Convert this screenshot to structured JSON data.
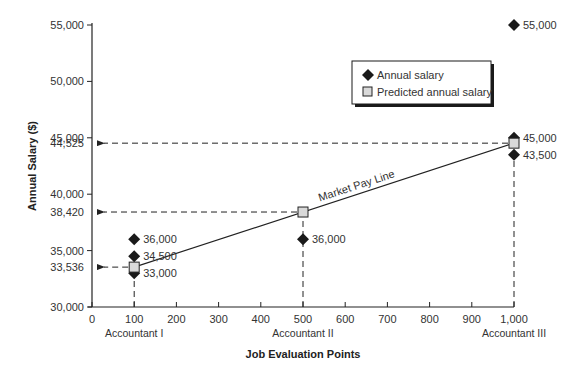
{
  "chart_data": {
    "type": "scatter",
    "title": "",
    "xlabel": "Job Evaluation Points",
    "ylabel": "Annual Salary ($)",
    "xlim": [
      0,
      1000
    ],
    "ylim": [
      30000,
      55000
    ],
    "x_ticks": [
      0,
      100,
      200,
      300,
      400,
      500,
      600,
      700,
      800,
      900,
      1000
    ],
    "x_tick_labels": [
      "0",
      "100",
      "200",
      "300",
      "400",
      "500",
      "600",
      "700",
      "800",
      "900",
      "1,000"
    ],
    "y_ticks": [
      30000,
      35000,
      40000,
      45000,
      50000,
      55000
    ],
    "y_tick_labels": [
      "30,000",
      "35,000",
      "40,000",
      "45,000",
      "50,000",
      "55,000"
    ],
    "y_extra_labels": [
      {
        "value": 33536,
        "label": "33,536"
      },
      {
        "value": 38420,
        "label": "38,420"
      },
      {
        "value": 44525,
        "label": "44,525"
      }
    ],
    "categories": [
      {
        "x": 100,
        "label": "Accountant I"
      },
      {
        "x": 500,
        "label": "Accountant II"
      },
      {
        "x": 1000,
        "label": "Accountant III"
      }
    ],
    "grid": false,
    "legend_position": "upper right",
    "series": [
      {
        "name": "Annual salary",
        "marker": "diamond",
        "color": "#1a1a1a",
        "points": [
          {
            "x": 100,
            "y": 36000,
            "label": "36,000"
          },
          {
            "x": 100,
            "y": 34500,
            "label": "34,500"
          },
          {
            "x": 100,
            "y": 33000,
            "label": "33,000"
          },
          {
            "x": 500,
            "y": 36000,
            "label": "36,000"
          },
          {
            "x": 1000,
            "y": 55000,
            "label": "55,000"
          },
          {
            "x": 1000,
            "y": 45000,
            "label": "45,000"
          },
          {
            "x": 1000,
            "y": 43500,
            "label": "43,500"
          }
        ]
      },
      {
        "name": "Predicted annual salary",
        "marker": "square",
        "color": "#d9d9d9",
        "points": [
          {
            "x": 100,
            "y": 33536
          },
          {
            "x": 500,
            "y": 38420
          },
          {
            "x": 1000,
            "y": 44525
          }
        ]
      }
    ],
    "annotations": [
      {
        "text": "Market Pay Line",
        "type": "line-label"
      }
    ]
  }
}
